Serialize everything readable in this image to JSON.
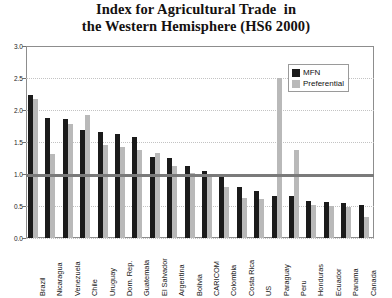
{
  "chart_data": {
    "type": "bar",
    "title": "Index for Agricultural Trade  in the Western Hemisphere (HS6 2000)",
    "title_lines": [
      "Index for Agricultural Trade  in",
      "the Western Hemisphere (HS6 2000)"
    ],
    "xlabel": "",
    "ylabel": "",
    "ylim": [
      0,
      3.0
    ],
    "yticks": [
      "0.0",
      "0.5",
      "1.0",
      "1.5",
      "2.0",
      "2.5",
      "3.0"
    ],
    "ytick_values": [
      0.0,
      0.5,
      1.0,
      1.5,
      2.0,
      2.5,
      3.0
    ],
    "grid": true,
    "grid_axis": "y",
    "reference_line": 1.0,
    "legend_position": "upper-right",
    "categories": [
      "Brazil",
      "Nicaragua",
      "Venezuela",
      "Chile",
      "Uruguay",
      "Dom. Rep.",
      "Guatemala",
      "El Salvador",
      "Argentina",
      "Bolivia",
      "CARICOM",
      "Colombia",
      "Costa Rica",
      "US",
      "Paraguay",
      "Peru",
      "Honduras",
      "Ecuador",
      "Panama",
      "Canada"
    ],
    "series": [
      {
        "name": "MFN",
        "color": "#1b1b1b",
        "values": [
          2.23,
          1.88,
          1.86,
          1.68,
          1.66,
          1.62,
          1.58,
          1.27,
          1.25,
          1.13,
          1.05,
          0.96,
          0.8,
          0.74,
          0.66,
          0.65,
          0.58,
          0.57,
          0.55,
          0.52
        ]
      },
      {
        "name": "Preferential",
        "color": "#b9b9b9",
        "values": [
          2.17,
          1.32,
          1.78,
          1.92,
          1.45,
          1.42,
          1.38,
          1.33,
          1.12,
          1.02,
          0.98,
          0.8,
          0.62,
          0.61,
          2.5,
          1.37,
          0.52,
          0.5,
          0.48,
          0.33
        ]
      }
    ]
  },
  "legend": {
    "items": [
      {
        "label": "MFN"
      },
      {
        "label": "Preferential"
      }
    ]
  }
}
